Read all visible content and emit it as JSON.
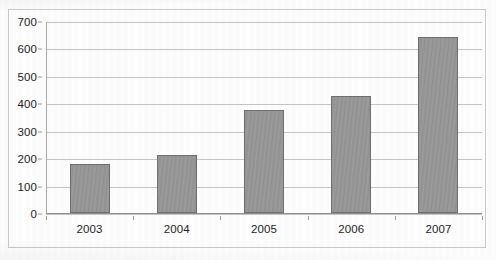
{
  "chart_data": {
    "type": "bar",
    "title": "",
    "subtitle": "",
    "xlabel": "",
    "ylabel": "",
    "categories": [
      "2003",
      "2004",
      "2005",
      "2006",
      "2007"
    ],
    "values": [
      178,
      213,
      375,
      425,
      640
    ],
    "ylim": [
      0,
      700
    ],
    "ytick_step": 100,
    "yticks": [
      "0",
      "100",
      "200",
      "300",
      "400",
      "500",
      "600",
      "700"
    ],
    "grid": true,
    "legend": false,
    "legend_position": "none",
    "series": [
      {
        "name": "",
        "values": [
          178,
          213,
          375,
          425,
          640
        ]
      }
    ],
    "colors": {
      "bar_fill": "#969696",
      "bar_border": "#6e6e6e",
      "gridline": "#c4c4c4",
      "axis": "#8f8f8f",
      "frame": "#c9c9c9",
      "text": "#1d1d1d",
      "background": "#fdfdfd"
    }
  }
}
